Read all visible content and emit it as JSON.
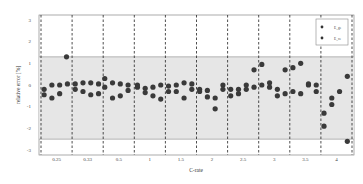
{
  "chart_data": {
    "type": "scatter",
    "title": "",
    "xlabel": "C-rate",
    "ylabel": "relative error [%]",
    "ylim": [
      -3,
      3
    ],
    "yticks": [
      "3",
      "2",
      "1",
      "0",
      "-1",
      "-2",
      "-3"
    ],
    "ytick_values": [
      3,
      2,
      1,
      0,
      -1,
      -2,
      -3
    ],
    "categories": [
      "0.25",
      "0.33",
      "0.5",
      "1",
      "1.5",
      "2",
      "2.5",
      "3",
      "3.5",
      "4"
    ],
    "band": {
      "upper": 1.3,
      "lower": -2.5
    },
    "grid": "dashed vertical separators between C-rate groups",
    "legend_position": "top-right",
    "legend": [
      "E_ge",
      "E_ce"
    ],
    "points": [
      {
        "cat": 0,
        "pos": 0.1,
        "y": -0.2
      },
      {
        "cat": 0,
        "pos": 0.1,
        "y": -0.45
      },
      {
        "cat": 0,
        "pos": 0.35,
        "y": 0.0
      },
      {
        "cat": 0,
        "pos": 0.35,
        "y": -0.6
      },
      {
        "cat": 0,
        "pos": 0.6,
        "y": 0.0
      },
      {
        "cat": 0,
        "pos": 0.6,
        "y": -0.4
      },
      {
        "cat": 0,
        "pos": 0.85,
        "y": 0.05
      },
      {
        "cat": 0,
        "pos": 0.82,
        "y": 1.3
      },
      {
        "cat": 1,
        "pos": 0.1,
        "y": 0.05
      },
      {
        "cat": 1,
        "pos": 0.1,
        "y": -0.2
      },
      {
        "cat": 1,
        "pos": 0.35,
        "y": 0.1
      },
      {
        "cat": 1,
        "pos": 0.35,
        "y": -0.3
      },
      {
        "cat": 1,
        "pos": 0.6,
        "y": 0.1
      },
      {
        "cat": 1,
        "pos": 0.6,
        "y": -0.45
      },
      {
        "cat": 1,
        "pos": 0.85,
        "y": 0.05
      },
      {
        "cat": 1,
        "pos": 0.85,
        "y": -0.4
      },
      {
        "cat": 2,
        "pos": 0.05,
        "y": 0.3
      },
      {
        "cat": 2,
        "pos": 0.05,
        "y": -0.1
      },
      {
        "cat": 2,
        "pos": 0.3,
        "y": 0.1
      },
      {
        "cat": 2,
        "pos": 0.3,
        "y": -0.6
      },
      {
        "cat": 2,
        "pos": 0.55,
        "y": 0.05
      },
      {
        "cat": 2,
        "pos": 0.55,
        "y": -0.5
      },
      {
        "cat": 2,
        "pos": 0.8,
        "y": 0.0
      },
      {
        "cat": 2,
        "pos": 0.8,
        "y": -0.25
      },
      {
        "cat": 3,
        "pos": 0.1,
        "y": 0.0
      },
      {
        "cat": 3,
        "pos": 0.1,
        "y": -0.1
      },
      {
        "cat": 3,
        "pos": 0.35,
        "y": -0.15
      },
      {
        "cat": 3,
        "pos": 0.35,
        "y": -0.35
      },
      {
        "cat": 3,
        "pos": 0.6,
        "y": -0.1
      },
      {
        "cat": 3,
        "pos": 0.6,
        "y": -0.5
      },
      {
        "cat": 3,
        "pos": 0.85,
        "y": 0.0
      },
      {
        "cat": 3,
        "pos": 0.85,
        "y": -0.65
      },
      {
        "cat": 4,
        "pos": 0.1,
        "y": -0.05
      },
      {
        "cat": 4,
        "pos": 0.1,
        "y": -0.3
      },
      {
        "cat": 4,
        "pos": 0.35,
        "y": 0.0
      },
      {
        "cat": 4,
        "pos": 0.35,
        "y": -0.3
      },
      {
        "cat": 4,
        "pos": 0.6,
        "y": 0.1
      },
      {
        "cat": 4,
        "pos": 0.6,
        "y": -0.6
      },
      {
        "cat": 4,
        "pos": 0.85,
        "y": 0.05
      },
      {
        "cat": 4,
        "pos": 0.85,
        "y": -0.2
      },
      {
        "cat": 5,
        "pos": 0.1,
        "y": -0.2
      },
      {
        "cat": 5,
        "pos": 0.1,
        "y": -0.3
      },
      {
        "cat": 5,
        "pos": 0.35,
        "y": -0.25
      },
      {
        "cat": 5,
        "pos": 0.35,
        "y": -0.55
      },
      {
        "cat": 5,
        "pos": 0.6,
        "y": -0.6
      },
      {
        "cat": 5,
        "pos": 0.6,
        "y": -1.1
      },
      {
        "cat": 5,
        "pos": 0.85,
        "y": 0.0
      },
      {
        "cat": 5,
        "pos": 0.85,
        "y": -0.2
      },
      {
        "cat": 6,
        "pos": 0.1,
        "y": -0.2
      },
      {
        "cat": 6,
        "pos": 0.1,
        "y": -0.5
      },
      {
        "cat": 6,
        "pos": 0.35,
        "y": -0.4
      },
      {
        "cat": 6,
        "pos": 0.35,
        "y": -0.2
      },
      {
        "cat": 6,
        "pos": 0.6,
        "y": -0.2
      },
      {
        "cat": 6,
        "pos": 0.6,
        "y": 0.0
      },
      {
        "cat": 6,
        "pos": 0.85,
        "y": 0.7
      },
      {
        "cat": 6,
        "pos": 0.85,
        "y": -0.1
      },
      {
        "cat": 7,
        "pos": 0.1,
        "y": 0.95
      },
      {
        "cat": 7,
        "pos": 0.1,
        "y": 0.0
      },
      {
        "cat": 7,
        "pos": 0.35,
        "y": 0.1
      },
      {
        "cat": 7,
        "pos": 0.35,
        "y": -0.1
      },
      {
        "cat": 7,
        "pos": 0.6,
        "y": -0.2
      },
      {
        "cat": 7,
        "pos": 0.6,
        "y": -0.5
      },
      {
        "cat": 7,
        "pos": 0.85,
        "y": 0.7
      },
      {
        "cat": 7,
        "pos": 0.85,
        "y": -0.4
      },
      {
        "cat": 8,
        "pos": 0.1,
        "y": 0.8
      },
      {
        "cat": 8,
        "pos": 0.1,
        "y": -0.3
      },
      {
        "cat": 8,
        "pos": 0.35,
        "y": 1.0
      },
      {
        "cat": 8,
        "pos": 0.35,
        "y": -0.4
      },
      {
        "cat": 8,
        "pos": 0.6,
        "y": 0.0
      },
      {
        "cat": 8,
        "pos": 0.6,
        "y": 0.05
      },
      {
        "cat": 8,
        "pos": 0.85,
        "y": 0.0
      },
      {
        "cat": 8,
        "pos": 0.85,
        "y": -0.3
      },
      {
        "cat": 9,
        "pos": 0.1,
        "y": -1.3
      },
      {
        "cat": 9,
        "pos": 0.1,
        "y": -1.9
      },
      {
        "cat": 9,
        "pos": 0.35,
        "y": -0.6
      },
      {
        "cat": 9,
        "pos": 0.35,
        "y": -0.9
      },
      {
        "cat": 9,
        "pos": 0.6,
        "y": -0.3
      },
      {
        "cat": 9,
        "pos": 0.85,
        "y": 0.4
      },
      {
        "cat": 9,
        "pos": 0.85,
        "y": -2.6
      }
    ]
  }
}
